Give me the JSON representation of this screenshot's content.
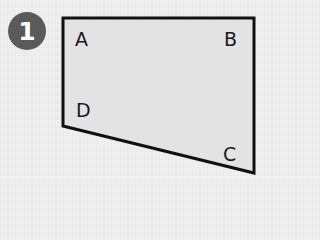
{
  "figure": {
    "number_badge": {
      "label": "1",
      "fill": "#5a5a5a",
      "text_color": "#ffffff"
    },
    "shape": {
      "type": "quadrilateral",
      "fill": "#e3e3e3",
      "stroke": "#111111",
      "points": "63,18 254,18 254,173 63,126",
      "vertices": [
        {
          "name": "A",
          "x": 63,
          "y": 18
        },
        {
          "name": "B",
          "x": 254,
          "y": 18
        },
        {
          "name": "C",
          "x": 254,
          "y": 173
        },
        {
          "name": "D",
          "x": 63,
          "y": 126
        }
      ]
    },
    "labels": {
      "a": "A",
      "b": "B",
      "c": "C",
      "d": "D"
    }
  }
}
